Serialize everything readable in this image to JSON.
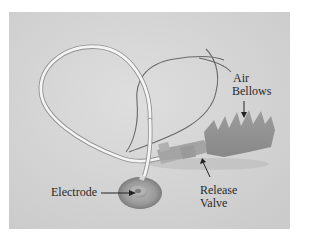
{
  "figure": {
    "background_color": "#d6d6d6"
  },
  "labels": {
    "air_bellows_line1": "Air",
    "air_bellows_line2": "Bellows",
    "release_valve_line1": "Release",
    "release_valve_line2": "Valve",
    "electrode": "Electrode"
  }
}
